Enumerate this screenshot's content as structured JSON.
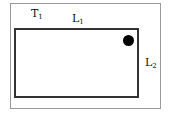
{
  "diagram": {
    "labels": {
      "t1": {
        "main": "T",
        "sub": "1"
      },
      "l1": {
        "main": "L",
        "sub": "1"
      },
      "l2": {
        "main": "L",
        "sub": "2"
      }
    },
    "colors": {
      "outer_border": "#9a9a9a",
      "inner_border": "#333333",
      "dot": "#000000"
    }
  }
}
